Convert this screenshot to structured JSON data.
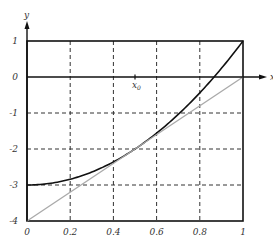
{
  "chart_data": {
    "type": "line",
    "title": "",
    "xlabel": "x",
    "ylabel": "y",
    "xlim": [
      0,
      1
    ],
    "ylim": [
      -4,
      1
    ],
    "grid": true,
    "grid_style": "dashed",
    "x_ticks": [
      0,
      0.2,
      0.4,
      0.6,
      0.8,
      1
    ],
    "x_tick_labels": [
      "0",
      "0.2",
      "0.4",
      "0.6",
      "0.8",
      "1"
    ],
    "y_ticks": [
      1,
      0,
      -1,
      -2,
      -3,
      -4
    ],
    "y_tick_labels": [
      "1",
      "0",
      "-1",
      "-2",
      "-3",
      "-4"
    ],
    "annotations": [
      {
        "text": "x",
        "sub": "0",
        "x": 0.5,
        "y": 0
      }
    ],
    "series": [
      {
        "name": "curve",
        "color": "#111111",
        "formula": "4x^2 - 3",
        "x": [
          0,
          0.1,
          0.2,
          0.3,
          0.4,
          0.5,
          0.6,
          0.7,
          0.8,
          0.9,
          1.0
        ],
        "y": [
          -3,
          -2.96,
          -2.84,
          -2.64,
          -2.36,
          -2,
          -1.56,
          -1.04,
          -0.44,
          0.24,
          1
        ]
      },
      {
        "name": "tangent-line",
        "color": "#aaaaaa",
        "formula": "4x - 4",
        "x": [
          0,
          1
        ],
        "y": [
          -4,
          0
        ]
      }
    ]
  }
}
